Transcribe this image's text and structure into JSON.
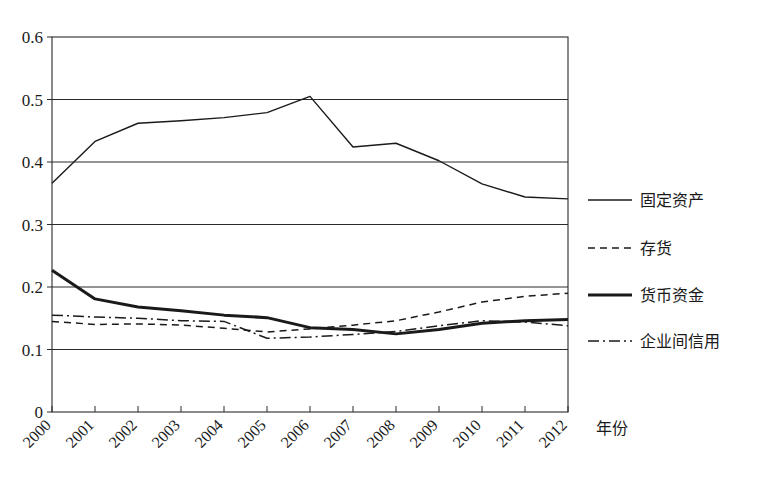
{
  "chart_data": {
    "type": "line",
    "title": "",
    "xlabel": "年份",
    "ylabel": "",
    "xlim": [
      2000,
      2012
    ],
    "ylim": [
      0,
      0.6
    ],
    "grid": true,
    "legend_position": "right",
    "categories": [
      "2000",
      "2001",
      "2002",
      "2003",
      "2004",
      "2005",
      "2006",
      "2007",
      "2008",
      "2009",
      "2010",
      "2011",
      "2012"
    ],
    "x": [
      2000,
      2001,
      2002,
      2003,
      2004,
      2005,
      2006,
      2007,
      2008,
      2009,
      2010,
      2011,
      2012
    ],
    "ytick_labels": [
      "0.6",
      "0.5",
      "0.4",
      "0.3",
      "0.2",
      "0.1",
      "0"
    ],
    "ytick_values": [
      0.6,
      0.5,
      0.4,
      0.3,
      0.2,
      0.1,
      0
    ],
    "series": [
      {
        "name": "固定资产",
        "style": "solid-thin",
        "values": [
          0.366,
          0.433,
          0.462,
          0.466,
          0.471,
          0.479,
          0.505,
          0.424,
          0.43,
          0.402,
          0.365,
          0.344,
          0.341
        ]
      },
      {
        "name": "存货",
        "style": "dashed",
        "values": [
          0.145,
          0.14,
          0.141,
          0.139,
          0.134,
          0.128,
          0.133,
          0.139,
          0.146,
          0.16,
          0.176,
          0.185,
          0.19
        ]
      },
      {
        "name": "货币资金",
        "style": "solid-thick",
        "values": [
          0.227,
          0.181,
          0.168,
          0.162,
          0.155,
          0.151,
          0.135,
          0.132,
          0.125,
          0.132,
          0.142,
          0.146,
          0.148
        ]
      },
      {
        "name": "企业间信用",
        "style": "dash-dot",
        "values": [
          0.155,
          0.152,
          0.15,
          0.146,
          0.145,
          0.118,
          0.12,
          0.124,
          0.129,
          0.138,
          0.146,
          0.144,
          0.138
        ]
      }
    ]
  },
  "legend": {
    "items": [
      {
        "label": "固定资产",
        "style": "solid-thin"
      },
      {
        "label": "存货",
        "style": "dashed"
      },
      {
        "label": "货币资金",
        "style": "solid-thick"
      },
      {
        "label": "企业间信用",
        "style": "dash-dot"
      }
    ]
  },
  "axes": {
    "x_axis_title": "年份"
  }
}
